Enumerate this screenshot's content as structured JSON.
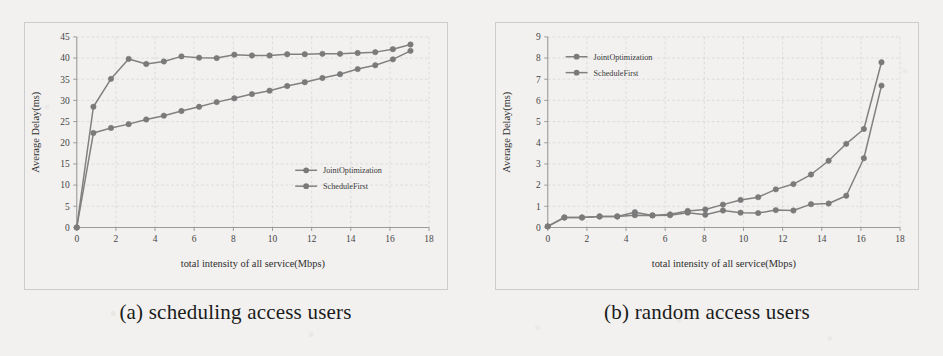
{
  "figure": {
    "background_color": "#f2f1ef",
    "line_color": "#808080",
    "marker_color": "#7a7a7a",
    "grid_color": "#c8c8d2",
    "axis_color": "#9a9a9a"
  },
  "panels": [
    {
      "caption": "(a) scheduling access users",
      "chart_data": {
        "type": "line",
        "title": "",
        "xlabel": "total intensity of all service(Mbps)",
        "ylabel": "Average Delay(ms)",
        "xlim": [
          0,
          18
        ],
        "ylim": [
          0,
          45
        ],
        "xticks": [
          0,
          2,
          4,
          6,
          8,
          10,
          12,
          14,
          16,
          18
        ],
        "yticks": [
          0,
          5,
          10,
          15,
          20,
          25,
          30,
          35,
          40,
          45
        ],
        "grid": true,
        "legend_position": "center-right",
        "series": [
          {
            "name": "JointOptimization",
            "x": [
              0,
              0.85,
              1.75,
              2.65,
              3.55,
              4.45,
              5.35,
              6.25,
              7.15,
              8.05,
              8.95,
              9.85,
              10.75,
              11.65,
              12.55,
              13.45,
              14.35,
              15.25,
              16.15,
              17.05
            ],
            "y": [
              0,
              28.5,
              35.1,
              39.8,
              38.6,
              39.2,
              40.4,
              40.1,
              40.0,
              40.8,
              40.6,
              40.6,
              40.9,
              40.9,
              41.0,
              41.0,
              41.2,
              41.4,
              42.1,
              43.2
            ]
          },
          {
            "name": "ScheduleFirst",
            "x": [
              0,
              0.85,
              1.75,
              2.65,
              3.55,
              4.45,
              5.35,
              6.25,
              7.15,
              8.05,
              8.95,
              9.85,
              10.75,
              11.65,
              12.55,
              13.45,
              14.35,
              15.25,
              16.15,
              17.05
            ],
            "y": [
              0,
              22.3,
              23.5,
              24.4,
              25.5,
              26.4,
              27.5,
              28.5,
              29.6,
              30.5,
              31.5,
              32.3,
              33.4,
              34.3,
              35.3,
              36.2,
              37.4,
              38.3,
              39.7,
              41.7
            ]
          }
        ]
      }
    },
    {
      "caption": "(b) random access users",
      "chart_data": {
        "type": "line",
        "title": "",
        "xlabel": "total intensity of all service(Mbps)",
        "ylabel": "Average Delay(ms)",
        "xlim": [
          0,
          18
        ],
        "ylim": [
          0,
          9
        ],
        "xticks": [
          0,
          2,
          4,
          6,
          8,
          10,
          12,
          14,
          16,
          18
        ],
        "yticks": [
          0,
          1,
          2,
          3,
          4,
          5,
          6,
          7,
          8,
          9
        ],
        "grid": true,
        "legend_position": "top-left",
        "series": [
          {
            "name": "JointOptimization",
            "x": [
              0,
              0.85,
              1.75,
              2.65,
              3.55,
              4.45,
              5.35,
              6.25,
              7.15,
              8.05,
              8.95,
              9.85,
              10.75,
              11.65,
              12.55,
              13.45,
              14.35,
              15.25,
              16.15,
              17.05
            ],
            "y": [
              0.05,
              0.47,
              0.47,
              0.52,
              0.52,
              0.72,
              0.57,
              0.62,
              0.78,
              0.85,
              1.08,
              1.3,
              1.43,
              1.8,
              2.05,
              2.5,
              3.15,
              3.95,
              4.65,
              7.8
            ]
          },
          {
            "name": "ScheduleFirst",
            "x": [
              0,
              0.85,
              1.75,
              2.65,
              3.55,
              4.45,
              5.35,
              6.25,
              7.15,
              8.05,
              8.95,
              9.85,
              10.75,
              11.65,
              12.55,
              13.45,
              14.35,
              15.25,
              16.15,
              17.05
            ],
            "y": [
              0.05,
              0.47,
              0.47,
              0.52,
              0.52,
              0.58,
              0.57,
              0.58,
              0.7,
              0.6,
              0.8,
              0.7,
              0.68,
              0.82,
              0.8,
              1.1,
              1.13,
              1.5,
              3.27,
              6.7
            ]
          }
        ]
      }
    }
  ]
}
